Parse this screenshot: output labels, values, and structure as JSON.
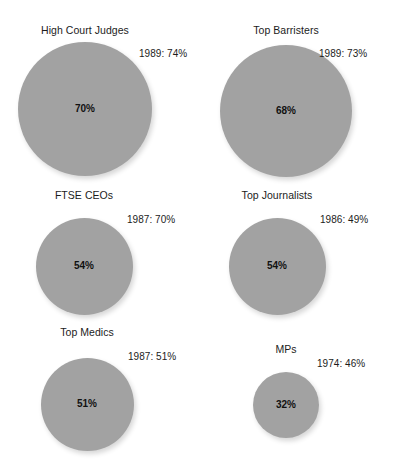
{
  "chart_data": {
    "type": "bubble",
    "title": "",
    "subtitle": "",
    "xlabel": "",
    "ylabel": "",
    "grid": false,
    "legend": null,
    "value_suffix": "%",
    "layout": {
      "columns": 2,
      "rows": 3
    },
    "bubble_color": "#a2a2a2",
    "background_color": "#ffffff",
    "categories": [
      "High Court Judges",
      "Top Barristers",
      "FTSE CEOs",
      "Top Journalists",
      "Top Medics",
      "MPs"
    ],
    "values": [
      70,
      68,
      54,
      54,
      51,
      32
    ],
    "value_labels": [
      "70%",
      "68%",
      "54%",
      "54%",
      "51%",
      "32%"
    ],
    "comparison_years": [
      1989,
      1989,
      1987,
      1986,
      1987,
      1974
    ],
    "comparison_values": [
      74,
      73,
      70,
      49,
      51,
      46
    ],
    "annotations": [
      "1989: 74%",
      "1989: 73%",
      "1987: 70%",
      "1986: 49%",
      "1987: 51%",
      "1974: 46%"
    ]
  },
  "panels": [
    {
      "title": "High Court Judges",
      "value_label": "70%",
      "annotation": "1989: 74%",
      "geometry": {
        "cx": 85,
        "cy": 109,
        "d": 134,
        "title_y": 25,
        "ann_x": 139,
        "ann_y": 48
      }
    },
    {
      "title": "Top Barristers",
      "value_label": "68%",
      "annotation": "1989: 73%",
      "geometry": {
        "cx": 286,
        "cy": 111,
        "d": 132,
        "title_y": 25,
        "ann_x": 319,
        "ann_y": 48
      }
    },
    {
      "title": "FTSE CEOs",
      "value_label": "54%",
      "annotation": "1987: 70%",
      "geometry": {
        "cx": 84,
        "cy": 266,
        "d": 97,
        "title_y": 190,
        "ann_x": 127,
        "ann_y": 214
      }
    },
    {
      "title": "Top Journalists",
      "value_label": "54%",
      "annotation": "1986: 49%",
      "geometry": {
        "cx": 277,
        "cy": 266,
        "d": 97,
        "title_y": 190,
        "ann_x": 320,
        "ann_y": 214
      }
    },
    {
      "title": "Top Medics",
      "value_label": "51%",
      "annotation": "1987: 51%",
      "geometry": {
        "cx": 87,
        "cy": 404,
        "d": 93,
        "title_y": 327,
        "ann_x": 128,
        "ann_y": 351
      }
    },
    {
      "title": "MPs",
      "value_label": "32%",
      "annotation": "1974: 46%",
      "geometry": {
        "cx": 286,
        "cy": 405,
        "d": 66,
        "title_y": 344,
        "ann_x": 317,
        "ann_y": 358
      }
    }
  ]
}
